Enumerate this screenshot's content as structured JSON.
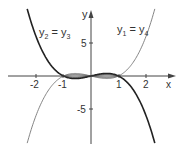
{
  "chart_data": {
    "type": "line",
    "title": "",
    "xlabel": "x",
    "ylabel": "y",
    "xlim": [
      -3.2,
      3.2
    ],
    "ylim": [
      -11,
      10
    ],
    "x_ticks": [
      -2,
      -1,
      1,
      2
    ],
    "y_ticks": [
      5,
      -5
    ],
    "grid": false,
    "series": [
      {
        "name": "y1 = y4",
        "function": "x^3 - x",
        "style": "thin",
        "color": "#555555",
        "x": [
          -2.3,
          -2,
          -1.5,
          -1,
          -0.5,
          0,
          0.5,
          1,
          1.5,
          2,
          2.3
        ],
        "values": [
          -9.87,
          -6,
          -1.88,
          0,
          0.38,
          0,
          -0.38,
          0,
          1.88,
          6,
          9.87
        ]
      },
      {
        "name": "y2 = y3",
        "function": "x - x^3",
        "style": "bold",
        "color": "#222222",
        "x": [
          -2.3,
          -2,
          -1.5,
          -1,
          -0.5,
          0,
          0.5,
          1,
          1.5,
          2,
          2.3
        ],
        "values": [
          9.87,
          6,
          1.88,
          0,
          -0.38,
          0,
          0.38,
          0,
          -1.88,
          -6,
          -9.87
        ]
      }
    ],
    "annotations": [
      {
        "text_main": "y",
        "sub1": "2",
        "eq": "=",
        "text_main2": "y",
        "sub2": "3"
      },
      {
        "text_main": "y",
        "sub1": "1",
        "eq": "=",
        "text_main2": "y",
        "sub2": "4"
      }
    ]
  },
  "axes": {
    "x_label": "x",
    "y_label": "y",
    "ticks": {
      "xm2": "-2",
      "xm1": "-1",
      "x1": "1",
      "x2": "2",
      "y5": "5",
      "ym5": "-5"
    }
  },
  "labels": {
    "left": {
      "y": "y",
      "s1": "2",
      "eq": " = ",
      "y2": "y",
      "s2": "3"
    },
    "right": {
      "y": "y",
      "s1": "1",
      "eq": " = ",
      "y2": "y",
      "s2": "4"
    }
  }
}
